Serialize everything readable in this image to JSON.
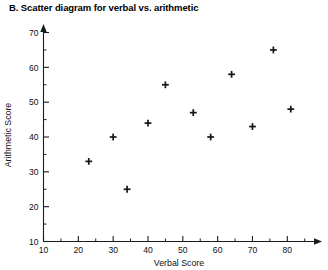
{
  "chart_data": {
    "type": "scatter",
    "title": "B. Scatter diagram for verbal vs. arithmetic",
    "xlabel": "Verbal Score",
    "ylabel": "Arithmetic Score",
    "xlim": [
      10,
      88
    ],
    "ylim": [
      10,
      72
    ],
    "xticks": [
      10,
      20,
      30,
      40,
      50,
      60,
      70,
      80
    ],
    "yticks": [
      10,
      20,
      30,
      40,
      50,
      60,
      70
    ],
    "xminorticks": [
      15,
      25,
      35,
      45,
      55,
      65,
      75,
      85
    ],
    "yminorticks": [
      15,
      25,
      35,
      45,
      55,
      65
    ],
    "xticklabels": [
      "10",
      "20",
      "30",
      "40",
      "50",
      "60",
      "70",
      "80"
    ],
    "yticklabels": [
      "10",
      "20",
      "30",
      "40",
      "50",
      "60",
      "70"
    ],
    "grid": false,
    "legend": false,
    "marker": "plus",
    "marker_color": "#151515",
    "x": [
      23,
      30,
      34,
      40,
      45,
      53,
      58,
      64,
      70,
      76,
      81
    ],
    "y": [
      33,
      40,
      25,
      44,
      55,
      47,
      40,
      58,
      43,
      65,
      48
    ],
    "points": [
      {
        "x": 23,
        "y": 33
      },
      {
        "x": 30,
        "y": 40
      },
      {
        "x": 34,
        "y": 25
      },
      {
        "x": 40,
        "y": 44
      },
      {
        "x": 45,
        "y": 55
      },
      {
        "x": 53,
        "y": 47
      },
      {
        "x": 58,
        "y": 40
      },
      {
        "x": 64,
        "y": 58
      },
      {
        "x": 70,
        "y": 43
      },
      {
        "x": 76,
        "y": 65
      },
      {
        "x": 81,
        "y": 48
      }
    ]
  }
}
